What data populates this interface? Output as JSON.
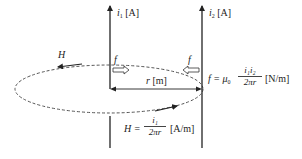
{
  "diagram": {
    "type": "parallel-wire-force",
    "colors": {
      "line": "#222222",
      "dashed_loop": "#555555",
      "text": "#222222",
      "background": "#ffffff"
    },
    "wires": [
      {
        "id": "wire-1",
        "current_symbol": "i",
        "current_sub": "1",
        "unit": "[A]"
      },
      {
        "id": "wire-2",
        "current_symbol": "i",
        "current_sub": "2",
        "unit": "[A]"
      }
    ],
    "field_label": "H",
    "force_labels": [
      "f",
      "f"
    ],
    "distance": {
      "symbol": "r",
      "unit": "[m]"
    },
    "force_formula": {
      "lhs": "f = μ",
      "lhs_sub": "0",
      "numerator": "i₁i₂",
      "denominator": "2πr",
      "unit": "[N/m]"
    },
    "field_formula": {
      "lhs": "H =",
      "numerator": "i₁",
      "denominator": "2πr",
      "unit": "[A/m]"
    }
  }
}
